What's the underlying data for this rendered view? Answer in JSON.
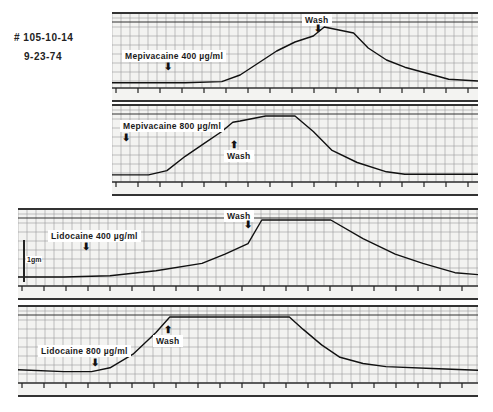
{
  "header": {
    "record_id": "# 105-10-14",
    "date": "9-23-74"
  },
  "scale": {
    "label": "1gm"
  },
  "chart_data": [
    {
      "type": "line",
      "title": "Mepivacaine 400 µg/ml",
      "drug": "Mepivacaine",
      "concentration": "400 µg/ml",
      "annotations": [
        {
          "text": "Mepivacaine 400 µg/ml",
          "arrow": "down",
          "x_frac": 0.15
        },
        {
          "text": "Wash",
          "arrow": "down",
          "x_frac": 0.56
        }
      ],
      "grid": true,
      "x": [
        0,
        0.1,
        0.2,
        0.3,
        0.35,
        0.4,
        0.45,
        0.5,
        0.55,
        0.58,
        0.62,
        0.66,
        0.7,
        0.75,
        0.8,
        0.86,
        0.92,
        1.0
      ],
      "values": [
        0.02,
        0.02,
        0.02,
        0.04,
        0.15,
        0.35,
        0.55,
        0.7,
        0.8,
        0.95,
        0.9,
        0.85,
        0.6,
        0.4,
        0.28,
        0.18,
        0.08,
        0.05
      ],
      "ylim": [
        0,
        1
      ],
      "xlabel": "",
      "ylabel": ""
    },
    {
      "type": "line",
      "title": "Mepivacaine 800 µg/ml",
      "drug": "Mepivacaine",
      "concentration": "800 µg/ml",
      "annotations": [
        {
          "text": "Mepivacaine 800 µg/ml",
          "arrow": "down",
          "x_frac": 0.03
        },
        {
          "text": "Wash",
          "arrow": "up",
          "x_frac": 0.33
        }
      ],
      "grid": true,
      "x": [
        0,
        0.1,
        0.15,
        0.2,
        0.25,
        0.3,
        0.33,
        0.35,
        0.42,
        0.5,
        0.55,
        0.6,
        0.67,
        0.75,
        0.8,
        0.9,
        1.0
      ],
      "values": [
        0.05,
        0.05,
        0.12,
        0.35,
        0.55,
        0.75,
        0.9,
        0.92,
        1.0,
        1.0,
        0.75,
        0.45,
        0.25,
        0.1,
        0.06,
        0.06,
        0.06
      ],
      "ylim": [
        0,
        1
      ],
      "xlabel": "",
      "ylabel": ""
    },
    {
      "type": "line",
      "title": "Lidocaine 400 µg/ml",
      "drug": "Lidocaine",
      "concentration": "400 µg/ml",
      "annotations": [
        {
          "text": "Lidocaine 400 µg/ml",
          "arrow": "down",
          "x_frac": 0.15
        },
        {
          "text": "Wash",
          "arrow": "down",
          "x_frac": 0.49
        }
      ],
      "grid": true,
      "x": [
        0,
        0.1,
        0.2,
        0.3,
        0.4,
        0.45,
        0.5,
        0.53,
        0.56,
        0.6,
        0.68,
        0.75,
        0.82,
        0.88,
        0.95,
        1.0
      ],
      "values": [
        0.08,
        0.08,
        0.1,
        0.18,
        0.3,
        0.45,
        0.62,
        1.0,
        1.0,
        1.0,
        1.0,
        0.7,
        0.45,
        0.3,
        0.15,
        0.12
      ],
      "ylim": [
        0,
        1
      ],
      "xlabel": "",
      "ylabel": ""
    },
    {
      "type": "line",
      "title": "Lidocaine 800 µg/ml",
      "drug": "Lidocaine",
      "concentration": "800 µg/ml",
      "annotations": [
        {
          "text": "Lidocaine 800 µg/ml",
          "arrow": "down",
          "x_frac": 0.16
        },
        {
          "text": "Wash",
          "arrow": "up",
          "x_frac": 0.33
        }
      ],
      "grid": true,
      "x": [
        0,
        0.1,
        0.16,
        0.2,
        0.25,
        0.3,
        0.33,
        0.4,
        0.5,
        0.59,
        0.62,
        0.66,
        0.7,
        0.75,
        0.8,
        0.9,
        1.0
      ],
      "values": [
        0.15,
        0.12,
        0.12,
        0.18,
        0.4,
        0.75,
        1.0,
        1.0,
        1.0,
        1.0,
        0.8,
        0.55,
        0.35,
        0.25,
        0.2,
        0.17,
        0.14
      ],
      "ylim": [
        0,
        1
      ],
      "xlabel": "",
      "ylabel": ""
    }
  ]
}
